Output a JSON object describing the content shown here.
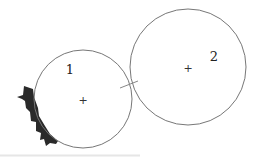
{
  "diagram": {
    "title": "",
    "circles": [
      {
        "label": "1",
        "cx": 83,
        "cy": 99,
        "r": 49,
        "center_marker": "+"
      },
      {
        "label": "2",
        "cx": 188,
        "cy": 67,
        "r": 58,
        "center_marker": "+"
      }
    ],
    "contact_tick": {
      "x1": 120,
      "y1": 88,
      "x2": 138,
      "y2": 81
    },
    "shaded_region": "jagged-dark-contact-area",
    "colors": {
      "stroke": "#777777",
      "shade": "#2a2a2a",
      "text": "#222222",
      "background": "#ffffff"
    }
  }
}
